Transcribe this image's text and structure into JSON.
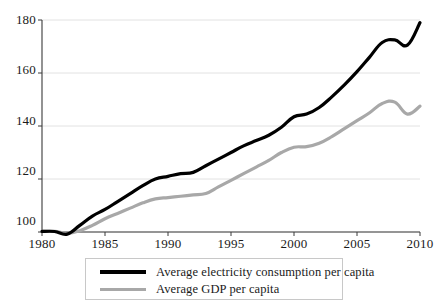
{
  "chart_data": {
    "type": "line",
    "title": "",
    "xlabel": "",
    "ylabel": "",
    "xlim": [
      1980,
      2010
    ],
    "ylim": [
      96,
      182
    ],
    "grid": true,
    "legend_position": "bottom",
    "xticks": [
      1980,
      1985,
      1990,
      1995,
      2000,
      2005,
      2010
    ],
    "yticks": [
      100,
      120,
      140,
      160,
      180
    ],
    "x": [
      1980,
      1981,
      1982,
      1983,
      1984,
      1985,
      1986,
      1987,
      1988,
      1989,
      1990,
      1991,
      1992,
      1993,
      1994,
      1995,
      1996,
      1997,
      1998,
      1999,
      2000,
      2001,
      2002,
      2003,
      2004,
      2005,
      2006,
      2007,
      2008,
      2009,
      2010
    ],
    "series": [
      {
        "name": "Average electricity consumption per capita",
        "color": "#000000",
        "width": 3.2,
        "values": [
          100.2,
          100.2,
          99.2,
          102.5,
          106.0,
          108.5,
          111.5,
          114.5,
          117.5,
          120.0,
          121.0,
          122.0,
          122.5,
          125.0,
          127.5,
          130.0,
          132.5,
          134.5,
          136.5,
          139.5,
          143.5,
          144.5,
          147.0,
          151.0,
          155.5,
          160.5,
          166.0,
          171.5,
          172.5,
          170.5,
          179.0
        ]
      },
      {
        "name": "Average GDP per capita",
        "color": "#a8a8a8",
        "width": 3.2,
        "values": [
          100.2,
          100.2,
          99.5,
          100.5,
          102.5,
          105.0,
          107.0,
          109.0,
          111.0,
          112.5,
          113.0,
          113.5,
          114.0,
          114.5,
          117.0,
          119.5,
          122.0,
          124.5,
          127.0,
          130.0,
          132.0,
          132.2,
          133.5,
          136.0,
          139.0,
          142.0,
          145.0,
          148.5,
          149.0,
          144.5,
          147.5
        ]
      }
    ]
  },
  "axis": {
    "ytick_labels": [
      "180",
      "160",
      "140",
      "120",
      "100"
    ],
    "xtick_labels": [
      "1980",
      "1985",
      "1990",
      "1995",
      "2000",
      "2005",
      "2010"
    ]
  },
  "legend": {
    "entries": [
      {
        "label": "Average electricity consumption per capita",
        "color": "#000000"
      },
      {
        "label": "Average GDP per capita",
        "color": "#a8a8a8"
      }
    ]
  }
}
